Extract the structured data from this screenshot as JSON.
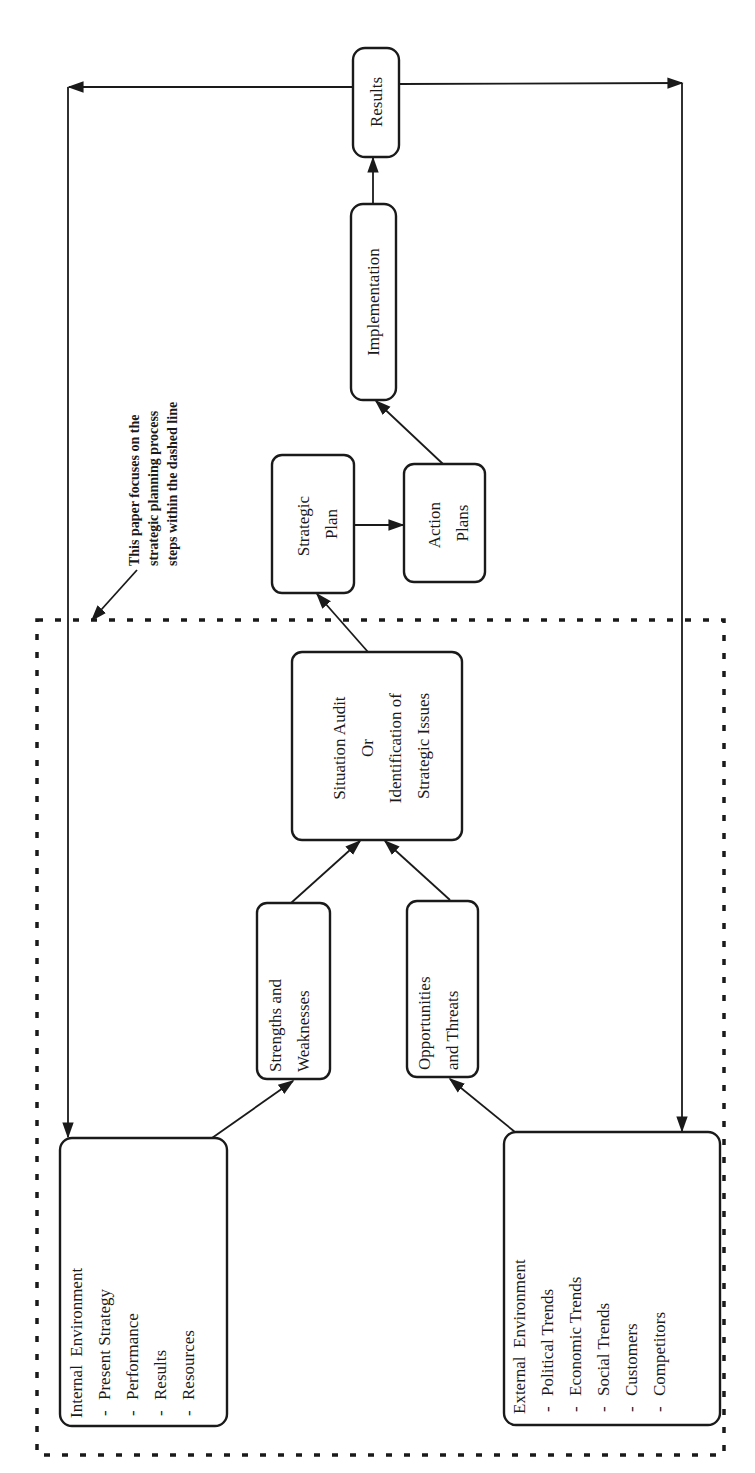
{
  "diagram": {
    "orientation": "rotated-90-ccw",
    "colors": {
      "ink": "#1a1a1a",
      "background": "#ffffff"
    },
    "nodes": {
      "internal": {
        "title": "Internal  Environment",
        "items": [
          "Present Strategy",
          "Performance",
          "Results",
          "Resources"
        ]
      },
      "external": {
        "title": "External  Environment",
        "items": [
          "Political Trends",
          "Economic Trends",
          "Social Trends",
          "Customers",
          "Competitors"
        ]
      },
      "strengths": {
        "lines": [
          "Strengths and",
          "Weaknesses"
        ]
      },
      "opportunities": {
        "lines": [
          "Opportunities",
          "and Threats"
        ]
      },
      "situation": {
        "lines": [
          "Situation Audit",
          "Or",
          "Identification of",
          "Strategic Issues"
        ]
      },
      "strategic_plan": {
        "lines": [
          "Strategic",
          "Plan"
        ]
      },
      "action_plans": {
        "lines": [
          "Action",
          "Plans"
        ]
      },
      "implementation": {
        "lines": [
          "Implementation"
        ]
      },
      "results": {
        "lines": [
          "Results"
        ]
      }
    },
    "note": {
      "lines": [
        "This paper focuses on the",
        "strategic planning process",
        "steps within the dashed line"
      ]
    },
    "bullet": "-",
    "edges": [
      [
        "internal",
        "strengths"
      ],
      [
        "external",
        "opportunities"
      ],
      [
        "strengths",
        "situation"
      ],
      [
        "opportunities",
        "situation"
      ],
      [
        "situation",
        "strategic_plan"
      ],
      [
        "strategic_plan",
        "action_plans"
      ],
      [
        "action_plans",
        "implementation"
      ],
      [
        "implementation",
        "results"
      ],
      [
        "results",
        "internal"
      ],
      [
        "results",
        "external"
      ]
    ]
  }
}
